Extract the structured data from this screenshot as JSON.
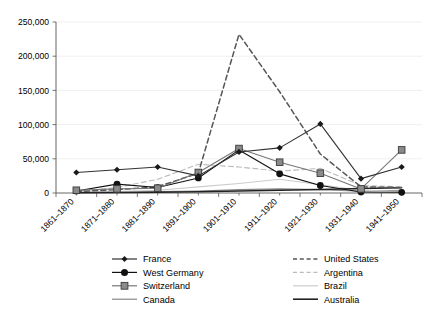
{
  "chart_data": {
    "type": "line",
    "title": "",
    "xlabel": "",
    "ylabel": "",
    "ylim": [
      0,
      250000
    ],
    "yticks": [
      0,
      50000,
      100000,
      150000,
      200000,
      250000
    ],
    "ytick_labels": [
      "0",
      "50,000",
      "100,000",
      "150,000",
      "200,000",
      "250,000"
    ],
    "grid": true,
    "legend_position": "bottom",
    "categories": [
      "1861–1870",
      "1871–1880",
      "1881–1890",
      "1891–1900",
      "1901–1910",
      "1911–1920",
      "1921–1930",
      "1931–1940",
      "1941–1950"
    ],
    "series": [
      {
        "name": "France",
        "marker": "diamond",
        "style": "solid",
        "color": "#333333",
        "values": [
          30000,
          34000,
          38000,
          25000,
          60000,
          66000,
          101000,
          21000,
          38000
        ]
      },
      {
        "name": "West Germany",
        "marker": "circle",
        "style": "solid",
        "color": "#111111",
        "values": [
          3000,
          13000,
          8000,
          22000,
          63000,
          28000,
          11000,
          1500,
          1000
        ]
      },
      {
        "name": "Switzerland",
        "marker": "square",
        "style": "solid",
        "color": "#777777",
        "values": [
          4000,
          6000,
          7000,
          30000,
          65000,
          45000,
          29000,
          6000,
          63000
        ]
      },
      {
        "name": "Canada",
        "marker": "none",
        "style": "solid",
        "color": "#888888",
        "values": [
          1000,
          1500,
          2000,
          3000,
          5000,
          6000,
          5000,
          2500,
          4000
        ]
      },
      {
        "name": "United States",
        "marker": "none",
        "style": "dashed",
        "color": "#555555",
        "values": [
          2000,
          5000,
          9000,
          29000,
          232000,
          148000,
          57000,
          9000,
          8000
        ]
      },
      {
        "name": "Argentina",
        "marker": "none",
        "style": "dashed",
        "color": "#bbbbbb",
        "values": [
          2000,
          8000,
          20000,
          42000,
          38000,
          32000,
          36000,
          11000,
          9000
        ]
      },
      {
        "name": "Brazil",
        "marker": "none",
        "style": "solid",
        "color": "#cccccc",
        "values": [
          1000,
          2000,
          4000,
          9000,
          14000,
          20000,
          12000,
          4000,
          2000
        ]
      },
      {
        "name": "Australia",
        "marker": "none",
        "style": "solid",
        "color": "#222222",
        "values": [
          500,
          800,
          1200,
          2000,
          3000,
          4000,
          5000,
          6500,
          7500
        ]
      }
    ]
  },
  "legend": {
    "entries": [
      {
        "label": "France"
      },
      {
        "label": "West Germany"
      },
      {
        "label": "Switzerland"
      },
      {
        "label": "Canada"
      },
      {
        "label": "United States"
      },
      {
        "label": "Argentina"
      },
      {
        "label": "Brazil"
      },
      {
        "label": "Australia"
      }
    ]
  }
}
